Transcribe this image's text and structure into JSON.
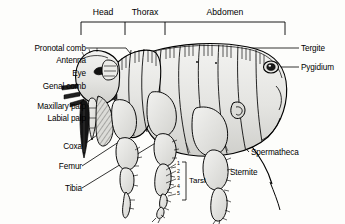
{
  "figure": {
    "background_color": "#fdfdfb",
    "line_color": "#000000",
    "body_fill": "#e8e8e6",
    "body_fill_dark": "#c9c9c6"
  },
  "segments": [
    {
      "name": "head",
      "label": "Head",
      "x": 96,
      "y": 13,
      "bracket_left": 81,
      "bracket_right": 125
    },
    {
      "name": "thorax",
      "label": "Thorax",
      "x": 135,
      "y": 13,
      "bracket_left": 125,
      "bracket_right": 165
    },
    {
      "name": "abdomen",
      "label": "Abdomen",
      "x": 203,
      "y": 13,
      "bracket_left": 165,
      "bracket_right": 285
    }
  ],
  "labels_left": [
    {
      "name": "pronotal-comb",
      "label": "Pronotal comb",
      "text_x": 8,
      "text_y": 44,
      "leader": "M 86,48 L 123,48 L 132,58"
    },
    {
      "name": "antenna",
      "label": "Antenna",
      "text_x": 42,
      "text_y": 56,
      "leader": "M 86,60 L 108,60"
    },
    {
      "name": "eye",
      "label": "Eye",
      "text_x": 58,
      "text_y": 69,
      "leader": "M 86,73 L 100,73"
    },
    {
      "name": "genal-comb",
      "label": "Genal comb",
      "text_x": 20,
      "text_y": 82,
      "leader": "M 86,86 L 101,86"
    },
    {
      "name": "maxillary-palp",
      "label": "Maxillary palp",
      "text_x": 10,
      "text_y": 102,
      "leader": "M 86,106 L 104,106"
    },
    {
      "name": "labial-palp",
      "label": "Labial palp",
      "text_x": 24,
      "text_y": 114,
      "leader": "M 86,118 L 100,118 L 108,112"
    },
    {
      "name": "coxa",
      "label": "Coxa",
      "text_x": 48,
      "text_y": 142,
      "leader": "M 82,146 L 140,104"
    },
    {
      "name": "femur",
      "label": "Femur",
      "text_x": 42,
      "text_y": 162,
      "leader": "M 82,166 L 152,120"
    },
    {
      "name": "tibia",
      "label": "Tibia",
      "text_x": 50,
      "text_y": 184,
      "leader": "M 82,188 L 160,140"
    }
  ],
  "labels_right": [
    {
      "name": "tergite",
      "label": "Tergite",
      "text_x": 301,
      "text_y": 44,
      "leader": "M 299,48 L 215,48 L 205,56"
    },
    {
      "name": "pygidium",
      "label": "Pygidium",
      "text_x": 301,
      "text_y": 63,
      "leader": "M 299,67 L 276,67"
    },
    {
      "name": "spermatheca",
      "label": "Spermatheca",
      "text_x": 251,
      "text_y": 148,
      "leader": "M 249,152 L 236,140 L 236,110"
    },
    {
      "name": "sternite",
      "label": "Sternite",
      "text_x": 230,
      "text_y": 168,
      "leader": "M 228,172 L 215,158 L 215,118"
    }
  ],
  "tarsi": {
    "name": "tarsi",
    "label": "Tarsi",
    "text_x": 192,
    "text_y": 178,
    "bracket_x": 186,
    "bracket_top": 162,
    "bracket_bottom": 200,
    "numbers": [
      "1",
      "2",
      "3",
      "4",
      "5"
    ],
    "number_x": 178,
    "number_start_y": 163,
    "number_step": 7.6,
    "tick_target_x": 168
  }
}
